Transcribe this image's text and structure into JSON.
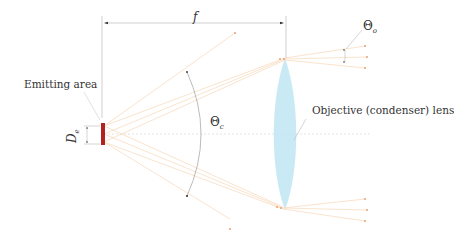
{
  "diagram": {
    "labels": {
      "focal_length": "f",
      "emitting_area": "Emitting area",
      "emitter_size_symbol": "D",
      "emitter_size_sub": "e",
      "collection_angle_symbol": "Θ",
      "collection_angle_sub": "c",
      "output_angle_symbol": "Θ",
      "output_angle_sub": "o",
      "lens": "Objective (condenser) lens"
    },
    "colors": {
      "emitter": "#b22222",
      "lens_fill": "#bfe6f2",
      "rays": "#f7dcc0",
      "ray_dots": "#e8a070",
      "dimension_lines": "#bbbbbb",
      "arc": "#999999",
      "axis": "#dddddd",
      "text": "#333333"
    }
  }
}
